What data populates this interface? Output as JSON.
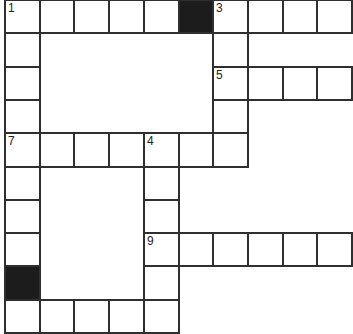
{
  "puzzle": {
    "type": "crossword",
    "grid": {
      "origin_x": 5,
      "origin_y": 0,
      "col_width": 34.7,
      "row_height": 33.3,
      "line_color": "#2f2f2f",
      "black_color": "#1c1c1c"
    },
    "cells": [
      {
        "r": 0,
        "c": 0,
        "type": "white",
        "number": "1"
      },
      {
        "r": 0,
        "c": 1,
        "type": "white"
      },
      {
        "r": 0,
        "c": 2,
        "type": "white"
      },
      {
        "r": 0,
        "c": 3,
        "type": "white"
      },
      {
        "r": 0,
        "c": 4,
        "type": "white"
      },
      {
        "r": 0,
        "c": 5,
        "type": "black"
      },
      {
        "r": 0,
        "c": 6,
        "type": "white",
        "number": "3"
      },
      {
        "r": 0,
        "c": 7,
        "type": "white"
      },
      {
        "r": 0,
        "c": 8,
        "type": "white"
      },
      {
        "r": 0,
        "c": 9,
        "type": "white"
      },
      {
        "r": 1,
        "c": 0,
        "type": "white"
      },
      {
        "r": 1,
        "c": 6,
        "type": "white"
      },
      {
        "r": 2,
        "c": 0,
        "type": "white"
      },
      {
        "r": 2,
        "c": 6,
        "type": "white",
        "number": "5"
      },
      {
        "r": 2,
        "c": 7,
        "type": "white"
      },
      {
        "r": 2,
        "c": 8,
        "type": "white"
      },
      {
        "r": 2,
        "c": 9,
        "type": "white"
      },
      {
        "r": 3,
        "c": 0,
        "type": "white"
      },
      {
        "r": 3,
        "c": 6,
        "type": "white"
      },
      {
        "r": 4,
        "c": 0,
        "type": "white",
        "number": "7"
      },
      {
        "r": 4,
        "c": 1,
        "type": "white"
      },
      {
        "r": 4,
        "c": 2,
        "type": "white"
      },
      {
        "r": 4,
        "c": 3,
        "type": "white"
      },
      {
        "r": 4,
        "c": 4,
        "type": "white",
        "number": "4"
      },
      {
        "r": 4,
        "c": 5,
        "type": "white"
      },
      {
        "r": 4,
        "c": 6,
        "type": "white"
      },
      {
        "r": 5,
        "c": 0,
        "type": "white"
      },
      {
        "r": 5,
        "c": 4,
        "type": "white"
      },
      {
        "r": 6,
        "c": 0,
        "type": "white"
      },
      {
        "r": 6,
        "c": 4,
        "type": "white"
      },
      {
        "r": 7,
        "c": 0,
        "type": "white"
      },
      {
        "r": 7,
        "c": 4,
        "type": "white",
        "number": "9"
      },
      {
        "r": 7,
        "c": 5,
        "type": "white"
      },
      {
        "r": 7,
        "c": 6,
        "type": "white"
      },
      {
        "r": 7,
        "c": 7,
        "type": "white"
      },
      {
        "r": 7,
        "c": 8,
        "type": "white"
      },
      {
        "r": 7,
        "c": 9,
        "type": "white"
      },
      {
        "r": 8,
        "c": 0,
        "type": "black"
      },
      {
        "r": 8,
        "c": 4,
        "type": "white"
      },
      {
        "r": 9,
        "c": 0,
        "type": "white"
      },
      {
        "r": 9,
        "c": 1,
        "type": "white"
      },
      {
        "r": 9,
        "c": 2,
        "type": "white"
      },
      {
        "r": 9,
        "c": 3,
        "type": "white"
      },
      {
        "r": 9,
        "c": 4,
        "type": "white"
      }
    ],
    "clue_numbers": [
      "1",
      "3",
      "4",
      "5",
      "7",
      "9"
    ]
  }
}
